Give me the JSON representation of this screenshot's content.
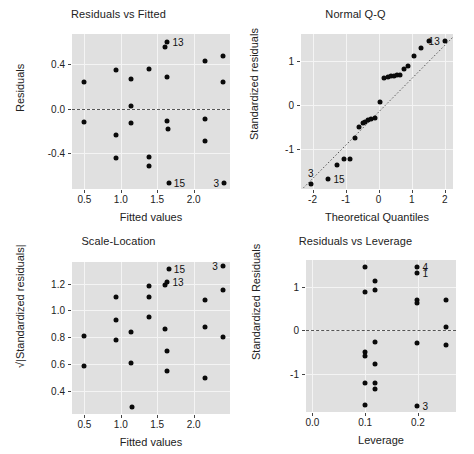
{
  "figure": {
    "kind": "regression-diagnostic-plots",
    "layout": "2x2",
    "background": "#ffffff",
    "panel_bg": "#e0e0e0",
    "grid_color": "#f4f4f4",
    "point_color": "#0a0a0a"
  },
  "chart_data": [
    {
      "id": "residuals-vs-fitted",
      "type": "scatter",
      "title": "Residuals vs Fitted",
      "xlabel": "Fitted values",
      "ylabel": "Residuals",
      "xticks": [
        0.5,
        1.0,
        1.5,
        2.0
      ],
      "xticklabels": [
        "0.5",
        "1.0",
        "1.5",
        "2.0"
      ],
      "yticks": [
        -0.4,
        0.0,
        0.4
      ],
      "yticklabels": [
        "-0.4",
        "0.0",
        "0.4"
      ],
      "xlim": [
        0.33,
        2.5
      ],
      "ylim": [
        -0.72,
        0.67
      ],
      "grid": true,
      "reference_line": {
        "type": "horizontal-dashed",
        "y": 0.0
      },
      "points": [
        {
          "x": 0.49,
          "y": 0.24
        },
        {
          "x": 0.49,
          "y": -0.12
        },
        {
          "x": 0.93,
          "y": 0.35
        },
        {
          "x": 0.93,
          "y": -0.24
        },
        {
          "x": 0.93,
          "y": -0.44
        },
        {
          "x": 1.14,
          "y": 0.27
        },
        {
          "x": 1.14,
          "y": 0.02
        },
        {
          "x": 1.14,
          "y": -0.13
        },
        {
          "x": 1.39,
          "y": 0.36
        },
        {
          "x": 1.39,
          "y": -0.43
        },
        {
          "x": 1.39,
          "y": -0.51
        },
        {
          "x": 1.61,
          "y": 0.55
        },
        {
          "x": 1.63,
          "y": 0.28
        },
        {
          "x": 1.63,
          "y": -0.11
        },
        {
          "x": 1.65,
          "y": -0.18
        },
        {
          "x": 1.64,
          "y": 0.6
        },
        {
          "x": 2.16,
          "y": 0.43
        },
        {
          "x": 2.16,
          "y": -0.09
        },
        {
          "x": 2.16,
          "y": -0.29
        },
        {
          "x": 2.4,
          "y": 0.47
        },
        {
          "x": 2.4,
          "y": 0.24
        },
        {
          "x": 1.66,
          "y": -0.67
        },
        {
          "x": 2.42,
          "y": -0.67
        }
      ],
      "annotations": [
        {
          "label": "13",
          "x": 1.64,
          "y": 0.6,
          "side": "right"
        },
        {
          "label": "15",
          "x": 1.66,
          "y": -0.67,
          "side": "right"
        },
        {
          "label": "3",
          "x": 2.42,
          "y": -0.67,
          "side": "left"
        }
      ]
    },
    {
      "id": "normal-qq",
      "type": "scatter",
      "title": "Normal Q-Q",
      "xlabel": "Theoretical Quantiles",
      "ylabel": "Standardized residuals",
      "xticks": [
        -2,
        -1,
        0,
        1,
        2
      ],
      "xticklabels": [
        "-2",
        "-1",
        "0",
        "1",
        "2"
      ],
      "yticks": [
        -1,
        0,
        1
      ],
      "yticklabels": [
        "-1",
        "0",
        "1"
      ],
      "xlim": [
        -2.35,
        2.25
      ],
      "ylim": [
        -1.9,
        1.62
      ],
      "grid": true,
      "reference_line": {
        "type": "qq-dotted-diagonal"
      },
      "points": [
        {
          "x": -2.05,
          "y": -1.78
        },
        {
          "x": -1.52,
          "y": -1.68
        },
        {
          "x": -1.25,
          "y": -1.35
        },
        {
          "x": -1.05,
          "y": -1.22
        },
        {
          "x": -0.88,
          "y": -1.21
        },
        {
          "x": -0.72,
          "y": -0.75
        },
        {
          "x": -0.58,
          "y": -0.5
        },
        {
          "x": -0.48,
          "y": -0.41
        },
        {
          "x": -0.4,
          "y": -0.37
        },
        {
          "x": -0.32,
          "y": -0.33
        },
        {
          "x": -0.22,
          "y": -0.3
        },
        {
          "x": -0.1,
          "y": -0.28
        },
        {
          "x": 0.05,
          "y": 0.07
        },
        {
          "x": 0.16,
          "y": 0.63
        },
        {
          "x": 0.27,
          "y": 0.64
        },
        {
          "x": 0.38,
          "y": 0.66
        },
        {
          "x": 0.47,
          "y": 0.67
        },
        {
          "x": 0.56,
          "y": 0.68
        },
        {
          "x": 0.66,
          "y": 0.69
        },
        {
          "x": 0.78,
          "y": 0.83
        },
        {
          "x": 0.9,
          "y": 0.9
        },
        {
          "x": 1.06,
          "y": 1.12
        },
        {
          "x": 1.28,
          "y": 1.3
        },
        {
          "x": 1.52,
          "y": 1.46
        },
        {
          "x": 2.0,
          "y": 1.47
        }
      ],
      "annotations": [
        {
          "label": "13",
          "x": 2.0,
          "y": 1.47,
          "side": "left"
        },
        {
          "label": "3",
          "x": -2.05,
          "y": -1.78,
          "side": "above"
        },
        {
          "label": "15",
          "x": -1.52,
          "y": -1.68,
          "side": "right"
        }
      ]
    },
    {
      "id": "scale-location",
      "type": "scatter",
      "title": "Scale-Location",
      "xlabel": "Fitted values",
      "ylabel": "√|Standardized residuals|",
      "xticks": [
        0.5,
        1.0,
        1.5,
        2.0
      ],
      "xticklabels": [
        "0.5",
        "1.0",
        "1.5",
        "2.0"
      ],
      "yticks": [
        0.4,
        0.6,
        0.8,
        1.0,
        1.2
      ],
      "yticklabels": [
        "0.4",
        "0.6",
        "0.8",
        "1.0",
        "1.2"
      ],
      "xlim": [
        0.33,
        2.5
      ],
      "ylim": [
        0.23,
        1.36
      ],
      "grid": true,
      "points": [
        {
          "x": 0.49,
          "y": 0.81
        },
        {
          "x": 0.49,
          "y": 0.59
        },
        {
          "x": 0.93,
          "y": 1.1
        },
        {
          "x": 0.93,
          "y": 0.93
        },
        {
          "x": 0.93,
          "y": 0.78
        },
        {
          "x": 1.14,
          "y": 0.84
        },
        {
          "x": 1.14,
          "y": 0.61
        },
        {
          "x": 1.15,
          "y": 0.28
        },
        {
          "x": 1.39,
          "y": 1.18
        },
        {
          "x": 1.39,
          "y": 1.1
        },
        {
          "x": 1.39,
          "y": 0.95
        },
        {
          "x": 1.61,
          "y": 1.19
        },
        {
          "x": 1.61,
          "y": 0.86
        },
        {
          "x": 1.63,
          "y": 0.7
        },
        {
          "x": 1.63,
          "y": 0.55
        },
        {
          "x": 1.66,
          "y": 1.31
        },
        {
          "x": 1.64,
          "y": 1.21
        },
        {
          "x": 2.16,
          "y": 1.08
        },
        {
          "x": 2.16,
          "y": 0.88
        },
        {
          "x": 2.16,
          "y": 0.5
        },
        {
          "x": 2.4,
          "y": 1.33
        },
        {
          "x": 2.4,
          "y": 1.15
        },
        {
          "x": 2.4,
          "y": 0.8
        }
      ],
      "annotations": [
        {
          "label": "15",
          "x": 1.66,
          "y": 1.31,
          "side": "right"
        },
        {
          "label": "13",
          "x": 1.64,
          "y": 1.21,
          "side": "right"
        },
        {
          "label": "3",
          "x": 2.4,
          "y": 1.33,
          "side": "left"
        }
      ]
    },
    {
      "id": "residuals-vs-leverage",
      "type": "scatter",
      "title": "Residuals vs Leverage",
      "xlabel": "Leverage",
      "ylabel": "Standardized Residuals",
      "xticks": [
        0.0,
        0.1,
        0.2
      ],
      "xticklabels": [
        "0.0",
        "0.1",
        "0.2"
      ],
      "yticks": [
        -1,
        0,
        1
      ],
      "yticklabels": [
        "-1",
        "0",
        "1"
      ],
      "xlim": [
        -0.012,
        0.272
      ],
      "ylim": [
        -1.88,
        1.62
      ],
      "grid": true,
      "reference_line": {
        "type": "horizontal-dashed",
        "y": 0.0
      },
      "points": [
        {
          "x": 0.099,
          "y": 1.46
        },
        {
          "x": 0.099,
          "y": 0.89
        },
        {
          "x": 0.099,
          "y": -0.5
        },
        {
          "x": 0.099,
          "y": -0.6
        },
        {
          "x": 0.099,
          "y": -1.21
        },
        {
          "x": 0.099,
          "y": -1.73
        },
        {
          "x": 0.119,
          "y": 1.13
        },
        {
          "x": 0.119,
          "y": 0.92
        },
        {
          "x": 0.119,
          "y": -0.26
        },
        {
          "x": 0.119,
          "y": -0.78
        },
        {
          "x": 0.119,
          "y": -1.22
        },
        {
          "x": 0.119,
          "y": -1.35
        },
        {
          "x": 0.199,
          "y": 1.46
        },
        {
          "x": 0.199,
          "y": 1.33
        },
        {
          "x": 0.199,
          "y": 0.7
        },
        {
          "x": 0.199,
          "y": 0.63
        },
        {
          "x": 0.199,
          "y": -0.29
        },
        {
          "x": 0.199,
          "y": -1.74
        },
        {
          "x": 0.253,
          "y": 0.69
        },
        {
          "x": 0.253,
          "y": 0.07
        },
        {
          "x": 0.253,
          "y": -0.33
        }
      ],
      "annotations": [
        {
          "label": "4",
          "x": 0.199,
          "y": 1.46,
          "side": "right"
        },
        {
          "label": "1",
          "x": 0.199,
          "y": 1.33,
          "side": "right"
        },
        {
          "label": "3",
          "x": 0.199,
          "y": -1.74,
          "side": "right"
        }
      ]
    }
  ]
}
